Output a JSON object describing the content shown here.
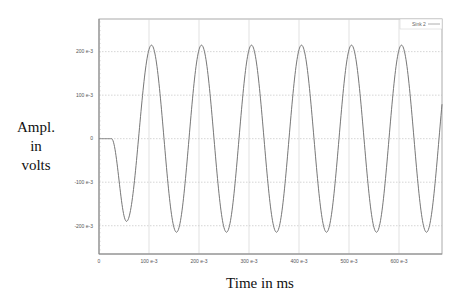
{
  "chart_data": {
    "type": "line",
    "title": "",
    "xlabel": "Time in ms",
    "ylabel": "Ampl. in volts",
    "ylabel_lines": [
      "Ampl.",
      "in",
      "volts"
    ],
    "xlim": [
      0,
      686
    ],
    "ylim": [
      -265,
      275
    ],
    "grid": true,
    "legend_position": "top-right",
    "x_ticks": [
      {
        "value": 0,
        "label": "0"
      },
      {
        "value": 100,
        "label": "100 e-3"
      },
      {
        "value": 200,
        "label": "200 e-3"
      },
      {
        "value": 300,
        "label": "300 e-3"
      },
      {
        "value": 400,
        "label": "400 e-3"
      },
      {
        "value": 500,
        "label": "500 e-3"
      },
      {
        "value": 600,
        "label": "600 e-3"
      }
    ],
    "y_ticks": [
      {
        "value": 200,
        "label": "200 e-3"
      },
      {
        "value": 100,
        "label": "100 e-3"
      },
      {
        "value": 0,
        "label": "0"
      },
      {
        "value": -100,
        "label": "-100 e-3"
      },
      {
        "value": -200,
        "label": "-200 e-3"
      }
    ],
    "series": [
      {
        "name": "Sink 2",
        "color": "#777777",
        "description": "flat at 0 until ~25 ms, first trough ~-190e-3 at ~55 ms, then sinusoid with amplitude ~215e-3 and period 100 ms",
        "x": [
          0,
          20,
          25,
          30,
          40,
          55,
          70,
          80,
          90,
          105,
          120,
          130,
          140,
          155,
          170,
          180,
          190,
          205,
          220,
          230,
          240,
          255,
          270,
          280,
          290,
          305,
          320,
          330,
          340,
          355,
          370,
          380,
          390,
          405,
          420,
          430,
          440,
          455,
          470,
          480,
          490,
          505,
          520,
          530,
          540,
          555,
          570,
          580,
          590,
          605,
          620,
          630,
          640,
          655,
          670,
          680,
          686
        ],
        "values": [
          0,
          0,
          -5,
          -40,
          -140,
          -190,
          -120,
          -30,
          90,
          215,
          125,
          0,
          -125,
          -215,
          -125,
          0,
          125,
          215,
          125,
          0,
          -125,
          -215,
          -125,
          0,
          125,
          215,
          125,
          0,
          -125,
          -215,
          -125,
          0,
          125,
          215,
          125,
          0,
          -125,
          -215,
          -125,
          0,
          125,
          215,
          125,
          0,
          -125,
          -215,
          -125,
          0,
          125,
          215,
          125,
          0,
          -125,
          -215,
          -125,
          0,
          80
        ]
      }
    ]
  },
  "legend": {
    "label": "Sink 2"
  },
  "axes": {
    "xlabel": "Time in ms",
    "ylabel_line1": "Ampl.",
    "ylabel_line2": "in",
    "ylabel_line3": "volts"
  }
}
